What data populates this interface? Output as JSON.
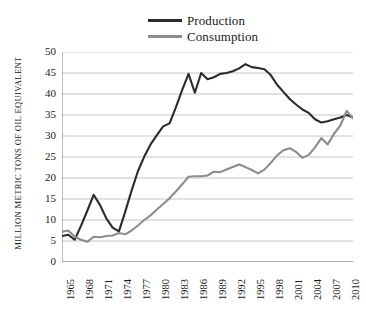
{
  "chart_data": {
    "type": "line",
    "title": "",
    "xlabel": "",
    "ylabel": "MILLION METRIC TONS OF OIL EQUIVALENT",
    "ylim": [
      0,
      50
    ],
    "ytick_values": [
      0,
      5,
      10,
      15,
      20,
      25,
      30,
      35,
      40,
      45,
      50
    ],
    "xlim": [
      1965,
      2011
    ],
    "xtick_labels": [
      "1965",
      "1968",
      "1971",
      "1974",
      "1977",
      "1980",
      "1983",
      "1986",
      "1989",
      "1992",
      "1995",
      "1998",
      "2001",
      "2004",
      "2007",
      "2010"
    ],
    "grid": "horizontal",
    "legend_position": "top-center",
    "x": [
      1965,
      1966,
      1967,
      1968,
      1969,
      1970,
      1971,
      1972,
      1973,
      1974,
      1975,
      1976,
      1977,
      1978,
      1979,
      1980,
      1981,
      1982,
      1983,
      1984,
      1985,
      1986,
      1987,
      1988,
      1989,
      1990,
      1991,
      1992,
      1993,
      1994,
      1995,
      1996,
      1997,
      1998,
      1999,
      2000,
      2001,
      2002,
      2003,
      2004,
      2005,
      2006,
      2007,
      2008,
      2009,
      2010,
      2011
    ],
    "series": [
      {
        "name": "Production",
        "color": "#2b2b2b",
        "values": [
          6.2,
          6.5,
          5.3,
          8.6,
          12.2,
          16.0,
          13.6,
          10.4,
          8.2,
          7.3,
          12.0,
          17.0,
          21.6,
          25.1,
          28.0,
          30.2,
          32.3,
          33.0,
          36.8,
          41.0,
          44.8,
          40.3,
          45.0,
          43.5,
          44.0,
          44.8,
          45.0,
          45.4,
          46.1,
          47.1,
          46.4,
          46.2,
          45.9,
          44.5,
          42.2,
          40.5,
          38.8,
          37.5,
          36.3,
          35.5,
          34.0,
          33.2,
          33.5,
          34.0,
          34.4,
          35.0,
          34.4
        ]
      },
      {
        "name": "Consumption",
        "color": "#8c8c8c",
        "values": [
          7.2,
          7.5,
          6.0,
          5.3,
          4.8,
          6.0,
          5.9,
          6.2,
          6.3,
          6.9,
          6.6,
          7.5,
          8.7,
          10.0,
          11.1,
          12.5,
          13.8,
          15.2,
          16.8,
          18.5,
          20.3,
          20.4,
          20.4,
          20.6,
          21.5,
          21.4,
          22.0,
          22.6,
          23.2,
          22.6,
          21.9,
          21.1,
          22.0,
          23.6,
          25.4,
          26.6,
          27.1,
          26.2,
          24.8,
          25.5,
          27.3,
          29.5,
          28.0,
          30.5,
          32.5,
          36.0,
          34.2
        ]
      }
    ]
  },
  "legend": {
    "items": [
      {
        "label": "Production",
        "color": "#2b2b2b"
      },
      {
        "label": "Consumption",
        "color": "#8c8c8c"
      }
    ]
  },
  "axes": {
    "y_title": "MILLION METRIC TONS OF OIL EQUIVALENT",
    "y_labels": [
      "50",
      "45",
      "40",
      "35",
      "30",
      "25",
      "20",
      "15",
      "10",
      "5",
      "0"
    ],
    "x_labels": [
      "1965",
      "1968",
      "1971",
      "1974",
      "1977",
      "1980",
      "1983",
      "1986",
      "1989",
      "1992",
      "1995",
      "1998",
      "2001",
      "2004",
      "2007",
      "2010"
    ]
  },
  "style": {
    "grid_color": "#b5b5b5",
    "axis_color": "#7a7a7a",
    "background": "#ffffff"
  }
}
